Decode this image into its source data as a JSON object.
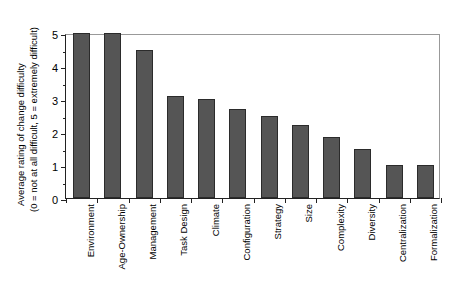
{
  "chart_data": {
    "type": "bar",
    "title": "",
    "xlabel": "",
    "ylabel_line1": "Average rating of change difficulty",
    "ylabel_line2": "(0 = not at all difficult, 5 = extremely difficult)",
    "categories": [
      "Environment",
      "Age-Ownership",
      "Management",
      "Task Design",
      "Climate",
      "Configuration",
      "Strategy",
      "Size",
      "Complexity",
      "Diversity",
      "Centralization",
      "Formalization"
    ],
    "values": [
      5.0,
      5.0,
      4.5,
      3.1,
      3.0,
      2.7,
      2.5,
      2.2,
      1.85,
      1.5,
      1.0,
      1.0
    ],
    "ylim": [
      0,
      5
    ],
    "ytick_values": [
      0,
      1,
      2,
      3,
      4,
      5
    ],
    "ytick_labels": [
      "0",
      "1",
      "2",
      "3",
      "4",
      "5"
    ],
    "yminor_values": [
      0.5,
      1.5,
      2.5,
      3.5,
      4.5
    ],
    "grid": false,
    "legend": "none",
    "bar_color": "#555555",
    "bar_edge_color": "#2b2b2b",
    "background_color": "#ffffff",
    "axis_color": "#222222"
  }
}
